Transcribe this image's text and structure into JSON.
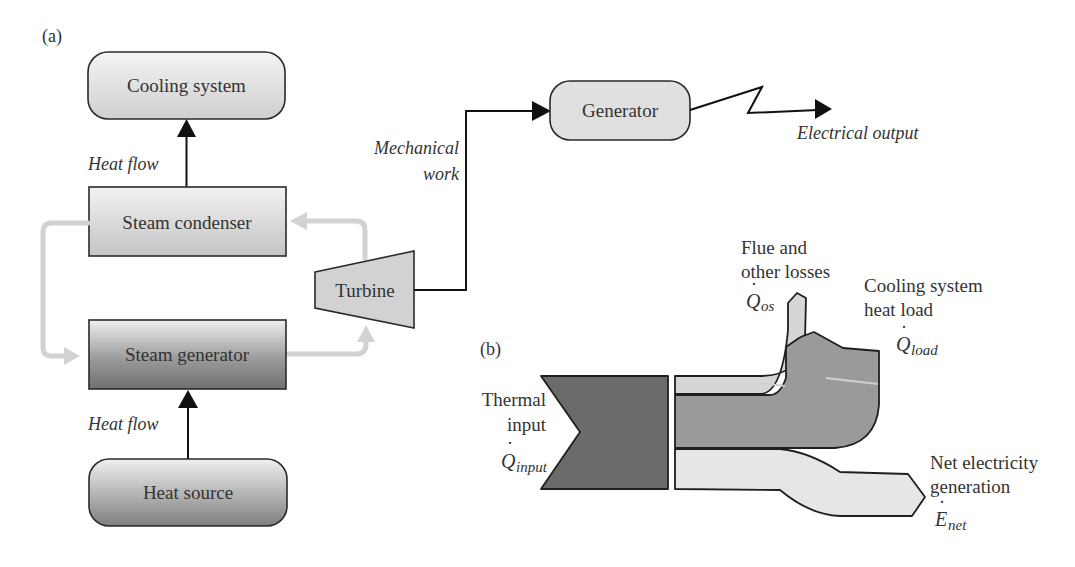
{
  "figure": {
    "panel_a_label": "(a)",
    "panel_b_label": "(b)"
  },
  "panel_a": {
    "nodes": {
      "cooling_system": "Cooling system",
      "steam_condenser": "Steam condenser",
      "steam_generator": "Steam generator",
      "heat_source": "Heat source",
      "turbine": "Turbine",
      "generator": "Generator"
    },
    "edge_labels": {
      "heat_flow_top": "Heat flow",
      "heat_flow_bottom": "Heat flow",
      "mechanical_work_line1": "Mechanical",
      "mechanical_work_line2": "work",
      "electrical_output": "Electrical output"
    }
  },
  "panel_b": {
    "thermal_input": {
      "line1": "Thermal",
      "line2": "input",
      "symbol": "Q",
      "subscript": "input"
    },
    "flue_losses": {
      "line1": "Flue and",
      "line2": "other losses",
      "symbol": "Q",
      "subscript": "os"
    },
    "cooling_load": {
      "line1": "Cooling system",
      "line2": "heat load",
      "symbol": "Q",
      "subscript": "load"
    },
    "net_electricity": {
      "line1": "Net electricity",
      "line2": "generation",
      "symbol": "E",
      "subscript": "net"
    }
  },
  "colors": {
    "dark_fill": "#6b6b6b",
    "mid_fill": "#9a9a9a",
    "light_fill": "#d6d6d6",
    "lighter_fill": "#e6e6e6",
    "cycle_arrow": "#d2d2d2",
    "line": "#111111"
  }
}
